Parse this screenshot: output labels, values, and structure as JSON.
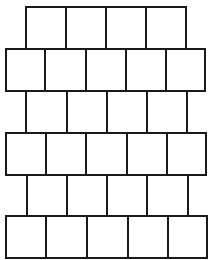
{
  "diagram": {
    "line_color": "#1a1a1a",
    "background_color": "#ffffff",
    "rows": [
      {
        "index": 1,
        "cell_count": 4,
        "top": 7,
        "bottom": 49,
        "x_edges": [
          26,
          66,
          106,
          146,
          186
        ]
      },
      {
        "index": 2,
        "cell_count": 5,
        "top": 49,
        "bottom": 91,
        "x_edges": [
          6,
          45,
          86,
          126,
          166,
          205
        ]
      },
      {
        "index": 3,
        "cell_count": 4,
        "top": 91,
        "bottom": 133,
        "x_edges": [
          26,
          67,
          107,
          147,
          187
        ]
      },
      {
        "index": 4,
        "cell_count": 5,
        "top": 133,
        "bottom": 175,
        "x_edges": [
          6,
          46,
          86,
          127,
          167,
          206
        ]
      },
      {
        "index": 5,
        "cell_count": 4,
        "top": 175,
        "bottom": 216,
        "x_edges": [
          27,
          67,
          107,
          147,
          188
        ]
      },
      {
        "index": 6,
        "cell_count": 5,
        "top": 216,
        "bottom": 258,
        "x_edges": [
          6,
          46,
          87,
          128,
          168,
          207
        ]
      }
    ]
  }
}
